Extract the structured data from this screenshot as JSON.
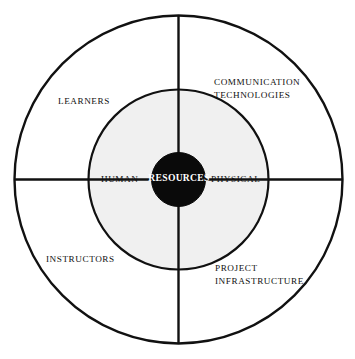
{
  "diagram": {
    "type": "concentric-circle-quadrant-diagram",
    "title": "Resources",
    "colors": {
      "background": "#ffffff",
      "stroke": "#111111",
      "middle_ring_fill": "#f0f0f0",
      "core_fill": "#0a0a0a",
      "core_text": "#ffffff",
      "label_text": "#111111"
    },
    "geometry": {
      "center_x": 178.5,
      "center_y": 179.5,
      "outer_radius": 164,
      "middle_radius": 90,
      "core_radius": 27,
      "stroke_width": 2.2
    },
    "core": {
      "label": "RESOURCES"
    },
    "middle_ring": {
      "labels": [
        {
          "id": "human",
          "text": "HUMAN",
          "quadrant": "left"
        },
        {
          "id": "physical",
          "text": "PHYSICAL",
          "quadrant": "right"
        }
      ]
    },
    "outer_ring": {
      "labels": [
        {
          "id": "learners",
          "text": "LEARNERS",
          "quadrant": "top-left"
        },
        {
          "id": "communication-technologies",
          "text": "COMMUNICATION\nTECHNOLOGIES",
          "quadrant": "top-right"
        },
        {
          "id": "instructors",
          "text": "INSTRUCTORS",
          "quadrant": "bottom-left"
        },
        {
          "id": "project-infrastructure",
          "text": "PROJECT\nINFRASTRUCTURE",
          "quadrant": "bottom-right"
        }
      ]
    },
    "dividers": [
      {
        "id": "vertical-divider",
        "orientation": "vertical"
      },
      {
        "id": "horizontal-divider",
        "orientation": "horizontal"
      }
    ]
  }
}
